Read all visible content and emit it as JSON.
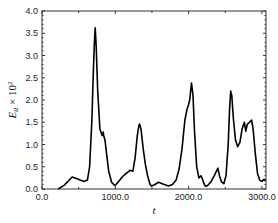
{
  "chart_data": {
    "type": "line",
    "title": "",
    "xlabel": "t",
    "ylabel": "E_a × 10^2",
    "ylabel_parts": {
      "main": "E",
      "sub": "a",
      "times": " × 10",
      "sup": "2"
    },
    "xlim": [
      0,
      3050
    ],
    "ylim": [
      0,
      4.0
    ],
    "x_ticks": [
      0,
      1000,
      2000,
      3000
    ],
    "x_tick_labels": [
      "0.0",
      "1000.0",
      "2000.0",
      "3000.0"
    ],
    "y_ticks": [
      0,
      0.5,
      1.0,
      1.5,
      2.0,
      2.5,
      3.0,
      3.5,
      4.0
    ],
    "y_tick_labels": [
      "0.0",
      "0.5",
      "1.0",
      "1.5",
      "2.0",
      "2.5",
      "3.0",
      "3.5",
      "4.0"
    ],
    "grid": false,
    "legend": null,
    "series": [
      {
        "name": "E_a",
        "color": "#000000",
        "x": [
          220,
          300,
          360,
          410,
          460,
          520,
          575,
          620,
          650,
          680,
          700,
          715,
          726,
          740,
          760,
          790,
          820,
          835,
          845,
          860,
          880,
          910,
          950,
          990,
          1010,
          1050,
          1100,
          1150,
          1200,
          1240,
          1270,
          1300,
          1320,
          1330,
          1350,
          1380,
          1410,
          1440,
          1470,
          1490,
          1530,
          1590,
          1650,
          1725,
          1780,
          1830,
          1870,
          1910,
          1950,
          1980,
          2000,
          2015,
          2040,
          2060,
          2080,
          2110,
          2140,
          2170,
          2190,
          2210,
          2230,
          2260,
          2300,
          2350,
          2400,
          2420,
          2450,
          2480,
          2510,
          2540,
          2560,
          2575,
          2590,
          2610,
          2640,
          2670,
          2700,
          2730,
          2760,
          2780,
          2800,
          2830,
          2860,
          2880,
          2910,
          2940,
          2970,
          3000,
          3030,
          3050
        ],
        "y": [
          0.0,
          0.08,
          0.18,
          0.27,
          0.24,
          0.2,
          0.17,
          0.2,
          0.5,
          1.5,
          2.6,
          3.3,
          3.62,
          3.2,
          2.2,
          1.35,
          1.2,
          1.28,
          1.18,
          1.1,
          0.8,
          0.4,
          0.15,
          0.08,
          0.1,
          0.18,
          0.28,
          0.35,
          0.42,
          0.4,
          0.7,
          1.2,
          1.42,
          1.46,
          1.35,
          0.9,
          0.55,
          0.3,
          0.12,
          0.07,
          0.09,
          0.15,
          0.11,
          0.07,
          0.1,
          0.2,
          0.45,
          0.9,
          1.55,
          1.8,
          1.9,
          2.0,
          2.38,
          2.1,
          1.3,
          0.5,
          0.25,
          0.3,
          0.22,
          0.12,
          0.06,
          0.08,
          0.15,
          0.3,
          0.47,
          0.3,
          0.16,
          0.12,
          0.3,
          1.0,
          1.8,
          2.2,
          2.1,
          1.6,
          1.1,
          0.95,
          1.05,
          1.35,
          1.5,
          1.3,
          1.45,
          1.5,
          1.55,
          1.35,
          0.8,
          0.35,
          0.2,
          0.17,
          0.22,
          0.18
        ]
      }
    ]
  }
}
